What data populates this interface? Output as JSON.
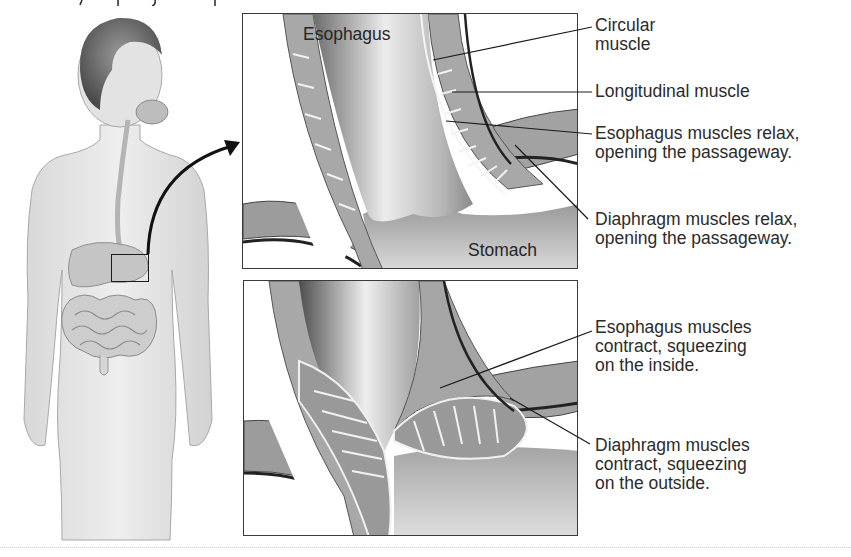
{
  "figure": {
    "left_illustration": {
      "subject": "human figure with digestive tract",
      "inset_box": "lower esophageal region"
    },
    "panels": [
      {
        "id": "relaxed",
        "in_panel_labels": [
          "Esophagus",
          "Stomach"
        ],
        "callouts": [
          {
            "text": "Circular\nmuscle"
          },
          {
            "text": "Longitudinal muscle"
          },
          {
            "text": "Esophagus muscles relax,\nopening the passageway."
          },
          {
            "text": "Diaphragm muscles relax,\nopening the passageway."
          }
        ]
      },
      {
        "id": "contracted",
        "in_panel_labels": [],
        "callouts": [
          {
            "text": "Esophagus muscles\ncontract, squeezing\non the inside."
          },
          {
            "text": "Diaphragm muscles\ncontract, squeezing\non the outside."
          }
        ]
      }
    ],
    "colors": {
      "line": "#1a1a1a",
      "tissue_dark": "#7a7a7a",
      "tissue_mid": "#a6a6a6",
      "tissue_light": "#d4d4d4",
      "skin": "#e6e6e6",
      "skin_shadow": "#c9c9c9"
    }
  }
}
